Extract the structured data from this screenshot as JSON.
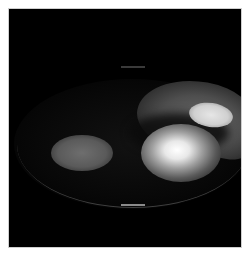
{
  "image": {
    "description": "Grayscale intensity image with bright elliptical blobs on black background",
    "background_color": "#000000",
    "border_color": "#ffffff",
    "regions": [
      {
        "name": "left-blob",
        "intensity": "medium"
      },
      {
        "name": "center-blob",
        "intensity": "high"
      },
      {
        "name": "top-right-blob",
        "intensity": "high"
      },
      {
        "name": "arc-region",
        "intensity": "low"
      }
    ]
  }
}
